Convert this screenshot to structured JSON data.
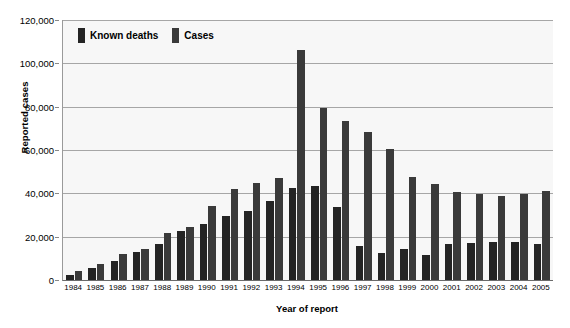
{
  "chart_data": {
    "type": "bar",
    "title": "",
    "xlabel": "Year of report",
    "ylabel": "Reported cases",
    "ylim": [
      0,
      120000
    ],
    "ytick_step": 20000,
    "ytick_labels": [
      "120,000",
      "100,000",
      "80,000",
      "60,000",
      "40,000",
      "20,000",
      "0"
    ],
    "ytick_values": [
      120000,
      100000,
      80000,
      60000,
      40000,
      20000,
      0
    ],
    "grid": true,
    "legend_position": "inside-top-left",
    "categories": [
      "1984",
      "1985",
      "1986",
      "1987",
      "1988",
      "1989",
      "1990",
      "1991",
      "1992",
      "1993",
      "1994",
      "1995",
      "1996",
      "1997",
      "1998",
      "1999",
      "2000",
      "2001",
      "2002",
      "2003",
      "2004",
      "2005"
    ],
    "series": [
      {
        "name": "Known deaths",
        "color": "#242424",
        "values": [
          2500,
          5500,
          9000,
          13000,
          16500,
          22500,
          26000,
          29500,
          32000,
          36500,
          42500,
          43500,
          33500,
          15500,
          12500,
          14500,
          11500,
          16500,
          17000,
          17500,
          17500,
          16500
        ]
      },
      {
        "name": "Cases",
        "color": "#3a3a3a",
        "values": [
          4000,
          7500,
          12000,
          14500,
          21500,
          24500,
          34000,
          42000,
          45000,
          47000,
          106000,
          79500,
          73500,
          68500,
          60500,
          47500,
          44500,
          40500,
          39500,
          39000,
          39500,
          41000
        ]
      }
    ]
  },
  "legend": {
    "items": [
      {
        "label": "Known deaths",
        "color": "#242424"
      },
      {
        "label": "Cases",
        "color": "#3a3a3a"
      }
    ]
  }
}
